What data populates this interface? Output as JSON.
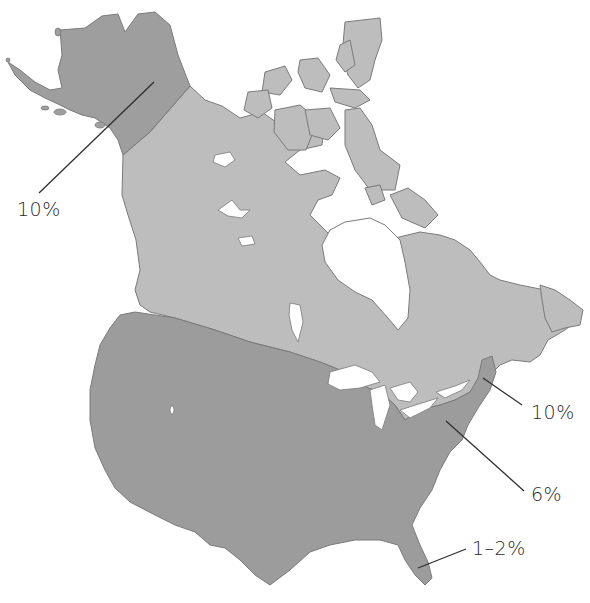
{
  "map": {
    "region": "North America (Alaska, Canada, contiguous United States)",
    "colors": {
      "background": "#ffffff",
      "canada": "#bdbdbd",
      "united_states": "#9c9c9c",
      "alaska": "#9e9e9e",
      "water": "#ffffff",
      "outline": "#7a7a7a",
      "leader_line": "#2f2f2f",
      "label_text": "#2a2a2a"
    },
    "regions": [
      {
        "name": "Alaska",
        "shade": "dark"
      },
      {
        "name": "Canada",
        "shade": "light"
      },
      {
        "name": "United States",
        "shade": "dark"
      }
    ],
    "annotations": [
      {
        "id": "alaska",
        "label": "10%",
        "target": "Alaska"
      },
      {
        "id": "new_england",
        "label": "10%",
        "target": "New England / Maine"
      },
      {
        "id": "mid_atlantic",
        "label": "6%",
        "target": "Eastern United States"
      },
      {
        "id": "florida",
        "label": "1–2%",
        "target": "Florida"
      }
    ]
  }
}
